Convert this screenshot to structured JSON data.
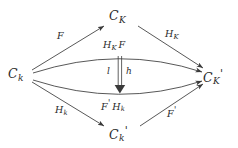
{
  "diagram": {
    "type": "commutative-diagram",
    "background_color": "#ffffff",
    "stroke_color": "#3a3a3a",
    "text_color": "#2b2b2b",
    "nodes": [
      {
        "id": "top",
        "label": "C_K",
        "base": "C",
        "sub": "K",
        "prime": "",
        "x": 120,
        "y": 18
      },
      {
        "id": "left",
        "label": "C_k",
        "base": "C",
        "sub": "k",
        "prime": "",
        "x": 20,
        "y": 75
      },
      {
        "id": "right",
        "label": "C_K'",
        "base": "C",
        "sub": "K",
        "prime": "'",
        "x": 213,
        "y": 75
      },
      {
        "id": "bottom",
        "label": "C_k'",
        "base": "C",
        "sub": "k",
        "prime": "'",
        "x": 120,
        "y": 133
      }
    ],
    "edges": [
      {
        "id": "left-to-top",
        "label": "F",
        "from": "left",
        "to": "top",
        "shape": "straight"
      },
      {
        "id": "top-to-right",
        "label": "H_K",
        "from": "top",
        "to": "right",
        "shape": "straight"
      },
      {
        "id": "left-to-bottom",
        "label": "H_k",
        "from": "left",
        "to": "bottom",
        "shape": "straight"
      },
      {
        "id": "bottom-to-right",
        "label": "F'",
        "from": "bottom",
        "to": "right",
        "shape": "straight"
      },
      {
        "id": "upper-curve",
        "label": "H_K F",
        "from": "left",
        "to": "right",
        "shape": "arc-up"
      },
      {
        "id": "lower-curve",
        "label": "F' H_k",
        "from": "left",
        "to": "right",
        "shape": "arc-down"
      }
    ],
    "two_cell": {
      "id": "natural-transformation",
      "style": "double-arrow-down",
      "left_label": "l",
      "right_label": "h",
      "from": "upper-curve",
      "to": "lower-curve"
    },
    "labels": {
      "F": "F",
      "H_K": "H",
      "H_K_sub": "K",
      "H_k": "H",
      "H_k_sub": "k",
      "F_prime": "F",
      "prime_mark": "'",
      "upper_curve_H": "H",
      "upper_curve_H_sub": "K",
      "upper_curve_F": "F",
      "lower_curve_F": "F",
      "lower_curve_H": "H",
      "lower_curve_H_sub": "k",
      "two_cell_left": "l",
      "two_cell_right": "h"
    }
  }
}
